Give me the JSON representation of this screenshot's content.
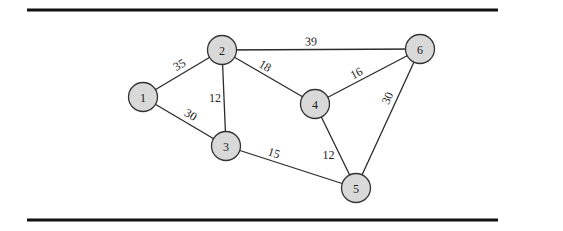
{
  "graph": {
    "title": "",
    "nodes": [
      {
        "id": "1",
        "label": "1"
      },
      {
        "id": "2",
        "label": "2"
      },
      {
        "id": "3",
        "label": "3"
      },
      {
        "id": "4",
        "label": "4"
      },
      {
        "id": "5",
        "label": "5"
      },
      {
        "id": "6",
        "label": "6"
      }
    ],
    "edges": [
      {
        "from": "1",
        "to": "2",
        "weight": "35"
      },
      {
        "from": "1",
        "to": "3",
        "weight": "30"
      },
      {
        "from": "2",
        "to": "3",
        "weight": "12"
      },
      {
        "from": "2",
        "to": "4",
        "weight": "18"
      },
      {
        "from": "2",
        "to": "6",
        "weight": "39"
      },
      {
        "from": "3",
        "to": "5",
        "weight": "15"
      },
      {
        "from": "4",
        "to": "5",
        "weight": "12"
      },
      {
        "from": "4",
        "to": "6",
        "weight": "16"
      },
      {
        "from": "5",
        "to": "6",
        "weight": "30"
      }
    ],
    "colors": {
      "node_fill": "#d9d9d9",
      "node_stroke": "#333333",
      "edge": "#2b2b2b",
      "rule": "#111111"
    }
  }
}
